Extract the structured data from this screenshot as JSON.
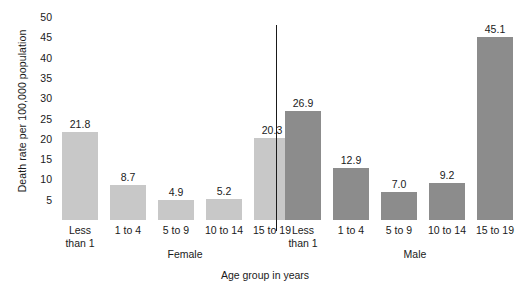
{
  "chart_data": {
    "type": "bar",
    "title": "",
    "xlabel": "Age group in years",
    "ylabel": "Death rate per 100,000 population",
    "categories": [
      "Less than 1",
      "1 to 4",
      "5 to 9",
      "10 to 14",
      "15 to 19"
    ],
    "series": [
      {
        "name": "Female",
        "values": [
          21.8,
          8.7,
          4.9,
          5.2,
          20.3
        ],
        "color": "#c8c8c8"
      },
      {
        "name": "Male",
        "values": [
          26.9,
          12.9,
          7.0,
          9.2,
          45.1
        ],
        "color": "#8c8c8c"
      }
    ],
    "ylim": [
      0,
      50
    ],
    "yticks": [
      50,
      45,
      40,
      35,
      30,
      25,
      20,
      15,
      10,
      5
    ],
    "ytick_labels": [
      "50",
      "45",
      "40",
      "35",
      "30",
      "25",
      "20",
      "15",
      "10",
      "5"
    ],
    "grid": false,
    "legend": "none",
    "group_divider": true,
    "value_labels": [
      "21.8",
      "8.7",
      "4.9",
      "5.2",
      "20.3",
      "26.9",
      "12.9",
      "7.0",
      "9.2",
      "45.1"
    ]
  },
  "axes": {
    "y_title": "Death rate per 100,000 population",
    "x_title": "Age group in years"
  },
  "groups": [
    {
      "label": "Female",
      "bars": [
        {
          "value_label": "21.8",
          "value": 21.8,
          "cat_line1": "Less",
          "cat_line2": "than 1"
        },
        {
          "value_label": "8.7",
          "value": 8.7,
          "cat_line1": "1 to 4",
          "cat_line2": ""
        },
        {
          "value_label": "4.9",
          "value": 4.9,
          "cat_line1": "5 to 9",
          "cat_line2": ""
        },
        {
          "value_label": "5.2",
          "value": 5.2,
          "cat_line1": "10 to 14",
          "cat_line2": ""
        },
        {
          "value_label": "20.3",
          "value": 20.3,
          "cat_line1": "15 to 19",
          "cat_line2": ""
        }
      ]
    },
    {
      "label": "Male",
      "bars": [
        {
          "value_label": "26.9",
          "value": 26.9,
          "cat_line1": "Less",
          "cat_line2": "than 1"
        },
        {
          "value_label": "12.9",
          "value": 12.9,
          "cat_line1": "1 to 4",
          "cat_line2": ""
        },
        {
          "value_label": "7.0",
          "value": 7.0,
          "cat_line1": "5 to 9",
          "cat_line2": ""
        },
        {
          "value_label": "9.2",
          "value": 9.2,
          "cat_line1": "10 to 14",
          "cat_line2": ""
        },
        {
          "value_label": "45.1",
          "value": 45.1,
          "cat_line1": "15 to 19",
          "cat_line2": ""
        }
      ]
    }
  ]
}
